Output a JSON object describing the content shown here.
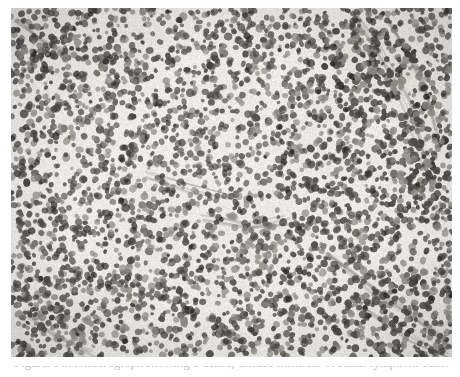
{
  "figure": {
    "kind": "photomicrograph",
    "modality": "brightfield light microscopy",
    "stain": "hematoxylin and eosin",
    "rendering": "grayscale",
    "caption_text": "Figure. Photomicrograph showing a dense, diffuse infiltrate of small lymphoid cells.",
    "caption_visibility": "cropped"
  },
  "plate": {
    "x": 11,
    "y": 8,
    "width": 441,
    "height": 349,
    "border_color": "#78766f",
    "background_color": "#efeeec"
  },
  "page": {
    "width": 460,
    "height": 377,
    "background_color": "#ffffff"
  },
  "palette": {
    "background_light": "#f2f1ef",
    "background_mid": "#e3e1dd",
    "nucleus_mid": "#8b8882",
    "nucleus_dark": "#4a4845",
    "nucleus_darkest": "#2a2927",
    "stroma_band": "#6b6862",
    "highlight": "#fbfbfa"
  },
  "image_content": {
    "type": "heatmap",
    "description": "Densely cellular lymphoid tissue; monotonous small round nuclei uniformly distributed with pale interstitial background.",
    "field_regions": [
      {
        "name": "upper-left-dense-focus",
        "cx": 0.09,
        "cy": 0.1,
        "rx": 0.1,
        "ry": 0.09,
        "darkness": 0.72
      },
      {
        "name": "upper-right-dense-band",
        "cx": 0.83,
        "cy": 0.18,
        "rx": 0.19,
        "ry": 0.17,
        "darkness": 0.8
      },
      {
        "name": "right-fibrous-band",
        "cx": 0.93,
        "cy": 0.42,
        "rx": 0.1,
        "ry": 0.26,
        "darkness": 0.74
      },
      {
        "name": "central-pale-zone",
        "cx": 0.44,
        "cy": 0.44,
        "rx": 0.26,
        "ry": 0.22,
        "darkness": 0.3
      },
      {
        "name": "lower-right-stromal-band",
        "cx": 0.88,
        "cy": 0.86,
        "rx": 0.16,
        "ry": 0.16,
        "darkness": 0.78
      },
      {
        "name": "lower-left-dense-focus",
        "cx": 0.1,
        "cy": 0.9,
        "rx": 0.11,
        "ry": 0.1,
        "darkness": 0.7
      },
      {
        "name": "mid-left-pale-zone",
        "cx": 0.16,
        "cy": 0.52,
        "rx": 0.13,
        "ry": 0.14,
        "darkness": 0.34
      },
      {
        "name": "bottom-center-mixed",
        "cx": 0.52,
        "cy": 0.82,
        "rx": 0.22,
        "ry": 0.14,
        "darkness": 0.55
      }
    ],
    "texture": {
      "nucleus_count": 5200,
      "nucleus_radius_px_min": 1.8,
      "nucleus_radius_px_max": 3.6,
      "seed": 20240117,
      "blur_px": 0.35,
      "noise_amount": 0.1
    }
  }
}
